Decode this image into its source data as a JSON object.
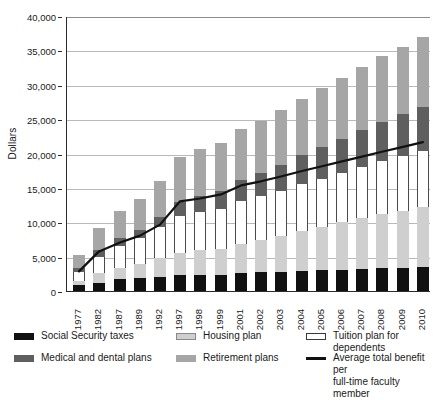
{
  "chart_data": {
    "type": "bar",
    "title": "",
    "subtitle": "",
    "xlabel": "",
    "ylabel": "Dollars",
    "ylim": [
      0,
      40000
    ],
    "ytick_step": 5000,
    "yticks": [
      "0",
      "5,000",
      "10,000",
      "15,000",
      "20,000",
      "25,000",
      "30,000",
      "35,000",
      "40,000"
    ],
    "ytick_values": [
      0,
      5000,
      10000,
      15000,
      20000,
      25000,
      30000,
      35000,
      40000
    ],
    "grid": true,
    "stacked": true,
    "legend_position": "bottom",
    "categories": [
      "1977",
      "1982",
      "1987",
      "1989",
      "1992",
      "1997",
      "1998",
      "1999",
      "2001",
      "2002",
      "2003",
      "2004",
      "2005",
      "2006",
      "2007",
      "2008",
      "2009",
      "2010"
    ],
    "series": [
      {
        "name": "Retirement plans",
        "key": "retirement",
        "color": "#a6a6a6",
        "values": [
          1900,
          3200,
          4000,
          4500,
          5200,
          6500,
          6800,
          7000,
          7400,
          7600,
          7900,
          8200,
          8600,
          8900,
          9200,
          9600,
          9800,
          10200
        ]
      },
      {
        "name": "Medical and dental plans",
        "key": "medical",
        "color": "#5f5f5f",
        "values": [
          700,
          900,
          1100,
          1200,
          1500,
          2100,
          2300,
          2500,
          3100,
          3400,
          3800,
          4200,
          4600,
          4900,
          5300,
          5700,
          6100,
          6500
        ]
      },
      {
        "name": "Tuition plan for dependents",
        "key": "tuition",
        "color": "#ffffff",
        "values": [
          1300,
          2400,
          3200,
          3700,
          4500,
          5300,
          5600,
          5900,
          6200,
          6400,
          6600,
          6800,
          7000,
          7200,
          7500,
          7700,
          7900,
          8100
        ]
      },
      {
        "name": "Housing plan",
        "key": "housing",
        "color": "#cfcfcf",
        "values": [
          500,
          1400,
          1700,
          2100,
          2700,
          3300,
          3500,
          3700,
          4300,
          4700,
          5200,
          5900,
          6300,
          6900,
          7400,
          7900,
          8300,
          8700
        ]
      },
      {
        "name": "Social Security taxes",
        "key": "social",
        "color": "#111111",
        "values": [
          900,
          1200,
          1700,
          1900,
          2100,
          2300,
          2400,
          2400,
          2600,
          2700,
          2800,
          2900,
          3000,
          3100,
          3200,
          3300,
          3400,
          3500
        ]
      }
    ],
    "line_series": {
      "name": "Average total benefit per full-time faculty member",
      "color": "#111111",
      "values": [
        3000,
        5900,
        7200,
        8200,
        9800,
        13200,
        13600,
        14200,
        15500,
        16100,
        16800,
        17600,
        18300,
        19000,
        19700,
        20400,
        21100,
        21800
      ]
    }
  },
  "legend": {
    "items": [
      {
        "label": "Social Security taxes",
        "swatch": "social"
      },
      {
        "label": "Medical and dental plans",
        "swatch": "medical"
      },
      {
        "label": "Housing plan",
        "swatch": "housing"
      },
      {
        "label": "Retirement plans",
        "swatch": "retirement"
      },
      {
        "label": "Tuition plan for dependents",
        "swatch": "tuition"
      },
      {
        "label": "Average total benefit per\nfull-time faculty member",
        "swatch": "line"
      }
    ]
  }
}
